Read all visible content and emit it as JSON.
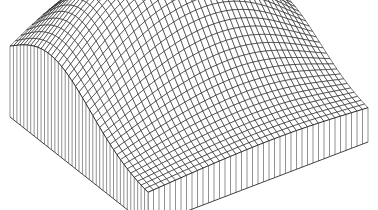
{
  "figure": {
    "type": "3d-wireframe-surface",
    "colors": {
      "background": "#ffffff",
      "lines": "#111111"
    },
    "grid": {
      "nu": 40,
      "nv": 40
    },
    "projection": {
      "origin": [
        148,
        196
      ],
      "u_axis": [
        220,
        -84
      ],
      "v_axis": [
        -138,
        -109
      ],
      "height_scale": 95,
      "base_wall_drop": 30
    },
    "peaks": [
      {
        "u": 0.28,
        "v": 0.72,
        "amp": 1.0,
        "sigma": 0.3
      },
      {
        "u": 0.72,
        "v": 0.62,
        "amp": 0.8,
        "sigma": 0.28
      }
    ],
    "base_level": 0.0
  }
}
